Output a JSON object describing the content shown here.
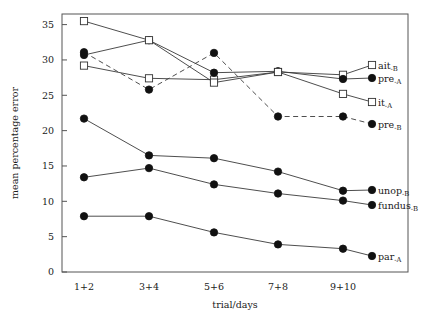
{
  "chart_data": {
    "type": "line",
    "title": "",
    "xlabel": "trial/days",
    "ylabel": "mean percentage error",
    "categories": [
      "1+2",
      "3+4",
      "5+6",
      "7+8",
      "9+10"
    ],
    "ylim": [
      0,
      36.5
    ],
    "yticks": [
      0,
      5,
      10,
      15,
      20,
      25,
      30,
      35
    ],
    "ytick_labels": [
      "0",
      "5",
      "10",
      "15",
      "20",
      "25",
      "30",
      "35"
    ],
    "grid": false,
    "legend_position": "right-inline-labels",
    "series": [
      {
        "name": "ait-B",
        "label_main": "ait",
        "label_sub": "-B",
        "marker": "open-square",
        "line": "solid",
        "values": [
          29.2,
          27.4,
          27.2,
          28.3,
          27.9
        ]
      },
      {
        "name": "pre-A",
        "label_main": "pre",
        "label_sub": "-A",
        "marker": "filled-circle",
        "line": "solid",
        "values": [
          30.7,
          32.8,
          28.2,
          28.4,
          27.3
        ]
      },
      {
        "name": "it-A",
        "label_main": "it",
        "label_sub": "-A",
        "marker": "open-square",
        "line": "solid",
        "values": [
          35.5,
          32.8,
          26.8,
          28.3,
          25.2
        ]
      },
      {
        "name": "pre-B",
        "label_main": "pre",
        "label_sub": "-B",
        "marker": "filled-circle",
        "line": "dashed",
        "values": [
          31.1,
          25.8,
          31.0,
          22.0,
          22.0
        ]
      },
      {
        "name": "unop-B",
        "label_main": "unop",
        "label_sub": "-B",
        "marker": "filled-circle",
        "line": "solid",
        "values": [
          21.7,
          16.5,
          16.1,
          14.2,
          11.5
        ]
      },
      {
        "name": "fundus-B",
        "label_main": "fundus",
        "label_sub": "-B",
        "marker": "filled-circle",
        "line": "solid",
        "values": [
          13.4,
          14.7,
          12.4,
          11.1,
          10.1
        ]
      },
      {
        "name": "par-A",
        "label_main": "par",
        "label_sub": "-A",
        "marker": "filled-circle",
        "line": "solid",
        "values": [
          7.9,
          7.9,
          5.6,
          3.9,
          3.3
        ]
      }
    ]
  },
  "axis": {
    "y_title": "mean percentage error",
    "x_title": "trial/days"
  }
}
